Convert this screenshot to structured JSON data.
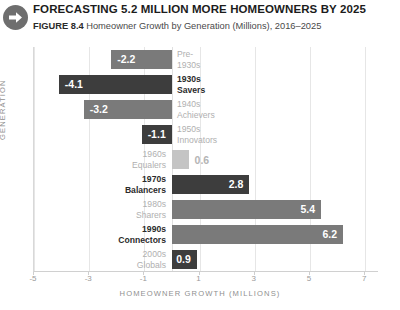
{
  "header": {
    "icon": "arrow-right-circle-icon",
    "title": "FORECASTING 5.2 MILLION MORE HOMEOWNERS BY 2025",
    "figure_label": "FIGURE 8.4",
    "subtitle": "Homeowner Growth by Generation (Millions), 2016–2025"
  },
  "colors": {
    "bar_dark": "#3d3d3d",
    "bar_medium": "#7a7a7a",
    "bar_light": "#c4c4c4",
    "label_strong": "#2b2b2b",
    "label_dim": "#b0b0b0",
    "gridline": "#e6e6e6",
    "axis_text": "#9a9a9a"
  },
  "chart_data": {
    "type": "bar",
    "orientation": "horizontal",
    "title": "FORECASTING 5.2 MILLION MORE HOMEOWNERS BY 2025",
    "subtitle": "Homeowner Growth by Generation (Millions), 2016–2025",
    "xlabel": "HOMEOWNER GROWTH (MILLIONS)",
    "ylabel": "GENERATION",
    "xlim": [
      -5,
      7.5
    ],
    "xticks": [
      -5,
      -3,
      -1,
      1,
      3,
      5,
      7
    ],
    "xticklabels": [
      "-5",
      "-3",
      "-1",
      "1",
      "3",
      "5",
      "7"
    ],
    "grid": true,
    "legend": false,
    "categories": [
      "Pre-1930s",
      "1930s Savers",
      "1940s Achievers",
      "1950s Innovators",
      "1960s Equalers",
      "1970s Balancers",
      "1980s Sharers",
      "1990s Connectors",
      "2000s Globals"
    ],
    "values": [
      -2.2,
      -4.1,
      -3.2,
      -1.1,
      0.6,
      2.8,
      5.4,
      6.2,
      0.9
    ],
    "bars": [
      {
        "line1": "Pre-",
        "line2": "1930s",
        "value": -2.2,
        "value_label": "-2.2",
        "shade": "medium",
        "label_style": "dim",
        "label_side": "right",
        "value_inside": true
      },
      {
        "line1": "1930s",
        "line2": "Savers",
        "value": -4.1,
        "value_label": "-4.1",
        "shade": "dark",
        "label_style": "strong",
        "label_side": "right",
        "value_inside": true
      },
      {
        "line1": "1940s",
        "line2": "Achievers",
        "value": -3.2,
        "value_label": "-3.2",
        "shade": "medium",
        "label_style": "dim",
        "label_side": "right",
        "value_inside": true
      },
      {
        "line1": "1950s",
        "line2": "Innovators",
        "value": -1.1,
        "value_label": "-1.1",
        "shade": "dark",
        "label_style": "dim",
        "label_side": "right",
        "value_inside": true
      },
      {
        "line1": "1960s",
        "line2": "Equalers",
        "value": 0.6,
        "value_label": "0.6",
        "shade": "light",
        "label_style": "dim",
        "label_side": "left",
        "value_inside": false
      },
      {
        "line1": "1970s",
        "line2": "Balancers",
        "value": 2.8,
        "value_label": "2.8",
        "shade": "dark",
        "label_style": "strong",
        "label_side": "left",
        "value_inside": true
      },
      {
        "line1": "1980s",
        "line2": "Sharers",
        "value": 5.4,
        "value_label": "5.4",
        "shade": "medium",
        "label_style": "dim",
        "label_side": "left",
        "value_inside": true
      },
      {
        "line1": "1990s",
        "line2": "Connectors",
        "value": 6.2,
        "value_label": "6.2",
        "shade": "medium",
        "label_style": "strong",
        "label_side": "left",
        "value_inside": true
      },
      {
        "line1": "2000s",
        "line2": "Globals",
        "value": 0.9,
        "value_label": "0.9",
        "shade": "dark",
        "label_style": "dim",
        "label_side": "left",
        "value_inside": true
      }
    ]
  }
}
